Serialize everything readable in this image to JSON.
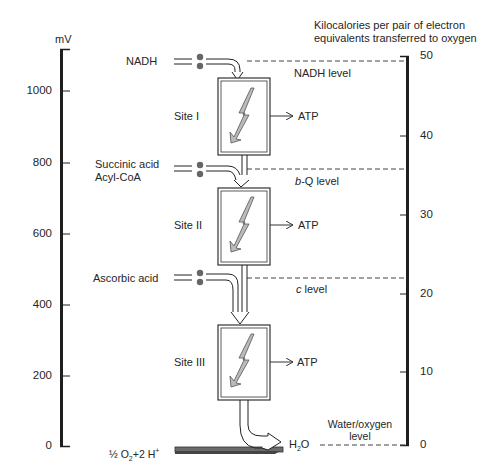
{
  "left_axis": {
    "unit": "mV",
    "ticks": [
      "1000",
      "800",
      "600",
      "400",
      "200",
      "0"
    ]
  },
  "right_axis": {
    "title_line1": "Kilocalories per pair of electron",
    "title_line2": "equivalents transferred to oxygen",
    "ticks": [
      "50",
      "40",
      "30",
      "20",
      "10",
      "0"
    ]
  },
  "inputs": {
    "nadh": "NADH",
    "succinic": "Succinic acid",
    "acylcoa": "Acyl-CoA",
    "ascorbic": "Ascorbic acid",
    "oxygen_prefix": "½ O",
    "oxygen_sub": "2",
    "oxygen_suffix": "+2 H",
    "oxygen_sup": "+"
  },
  "sites": [
    {
      "label": "Site I",
      "product": "ATP"
    },
    {
      "label": "Site II",
      "product": "ATP"
    },
    {
      "label": "Site III",
      "product": "ATP"
    }
  ],
  "levels": {
    "nadh": "NADH level",
    "bq_italic": "b",
    "bq_rest": "-Q level",
    "c_italic": "c",
    "c_rest": " level",
    "water_line1": "Water/oxygen",
    "water_line2": "level"
  },
  "product": {
    "h2o_prefix": "H",
    "h2o_sub": "2",
    "h2o_suffix": "O"
  },
  "colors": {
    "ink": "#1e1e1e",
    "gray_arrow": "#7a7a7a",
    "box_border": "#3a3a3a"
  }
}
